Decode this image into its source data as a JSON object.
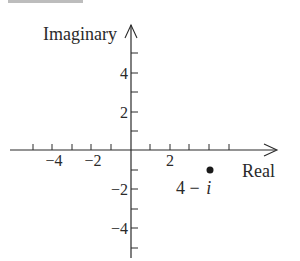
{
  "diagram": {
    "type": "complex-plane",
    "axes": {
      "x_label": "Real",
      "y_label": "Imaginary",
      "x_ticks": [
        {
          "value": -4,
          "label": "−4"
        },
        {
          "value": -2,
          "label": "−2"
        },
        {
          "value": 2,
          "label": "2"
        }
      ],
      "y_ticks": [
        {
          "value": 4,
          "label": "4"
        },
        {
          "value": 2,
          "label": "2"
        },
        {
          "value": -2,
          "label": "−2"
        },
        {
          "value": -4,
          "label": "−4"
        }
      ],
      "x_range": [
        -6,
        6
      ],
      "y_range": [
        -6,
        6
      ]
    },
    "points": [
      {
        "x": 4,
        "y": -1,
        "label_main": "4 − ",
        "label_italic": "i"
      }
    ],
    "colors": {
      "ink": "#2a2a2a",
      "background": "#ffffff"
    }
  }
}
